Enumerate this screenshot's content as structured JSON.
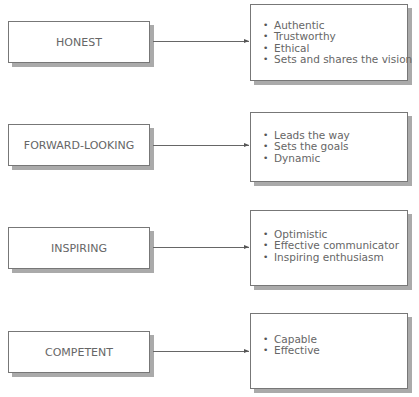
{
  "diagram": {
    "rows": [
      {
        "trait": "HONEST",
        "attributes": [
          "Authentic",
          "Trustworthy",
          "Ethical",
          "Sets and shares the vision"
        ]
      },
      {
        "trait": "FORWARD-LOOKING",
        "attributes": [
          "Leads the way",
          "Sets the goals",
          "Dynamic"
        ]
      },
      {
        "trait": "INSPIRING",
        "attributes": [
          "Optimistic",
          "Effective communicator",
          "Inspiring enthusiasm"
        ]
      },
      {
        "trait": "COMPETENT",
        "attributes": [
          "Capable",
          "Effective"
        ]
      }
    ],
    "colors": {
      "border": "#777777",
      "shadow": "#aaaaaa",
      "text": "#666666"
    }
  }
}
